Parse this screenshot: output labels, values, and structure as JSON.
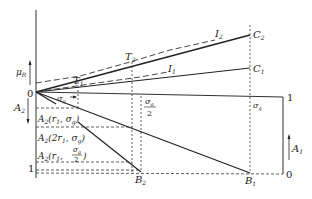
{
  "diagram": {
    "type": "construction-diagram",
    "axis_labels": {
      "mu_r": "μ",
      "mu_r_sub": "R",
      "a2": "A",
      "a2_sub": "2",
      "a1": "A",
      "a1_sub": "1"
    },
    "origin_label": "0",
    "one_right": "1",
    "zero_right": "0",
    "one_left": "1",
    "points": {
      "c2": {
        "main": "C",
        "sub": "2"
      },
      "c1": {
        "main": "C",
        "sub": "1"
      },
      "t2": {
        "main": "T",
        "sub": "2"
      },
      "t1": {
        "main": "T",
        "sub": "1"
      },
      "i2": {
        "main": "I",
        "sub": "2"
      },
      "i1": {
        "main": "I",
        "sub": "1"
      },
      "b2": {
        "main": "B",
        "sub": "2"
      },
      "b1": {
        "main": "B",
        "sub": "1"
      }
    },
    "sigma_g": "σ",
    "sigma_g_sub": "g",
    "sigma_half_num": "σ",
    "sigma_half_sub": "g",
    "sigma_half_den": "2",
    "rows": [
      {
        "prefix": "A",
        "sub": "2",
        "args": "(r",
        "argsub": "1",
        "rest": ", σ",
        "restsub": "g",
        "close": ")"
      },
      {
        "prefix": "A",
        "sub": "2",
        "args": "(2r",
        "argsub": "1",
        "rest": ", σ",
        "restsub": "g",
        "close": ")"
      },
      {
        "prefix": "A",
        "sub": "2",
        "args": "(r",
        "argsub": "1",
        "rest": ",",
        "frac_num": "σ",
        "frac_sub": "g",
        "frac_den": "2",
        "close": ")"
      }
    ]
  }
}
